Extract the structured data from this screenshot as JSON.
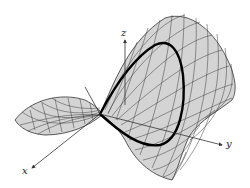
{
  "figure": {
    "axes": {
      "x": {
        "label": "x"
      },
      "y": {
        "label": "y"
      },
      "z": {
        "label": "z"
      }
    },
    "colors": {
      "surface_fill": "#d4d4d4",
      "mesh_lines": "#3a3a3a",
      "curve": "#000000",
      "axes": "#333333",
      "background": "#ffffff"
    }
  }
}
